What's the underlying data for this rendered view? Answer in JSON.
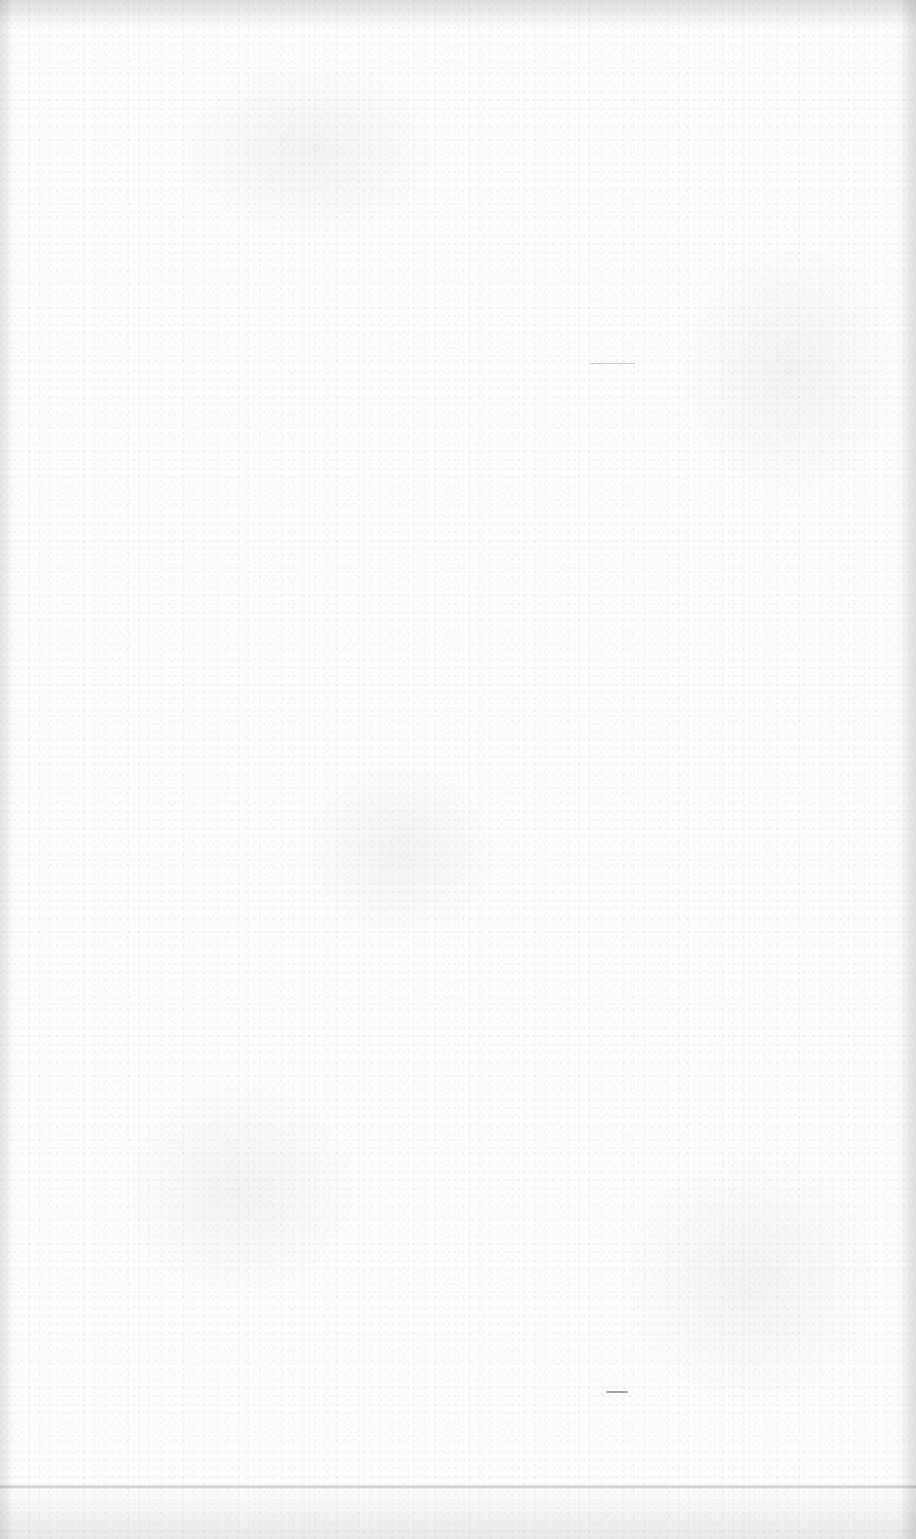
{
  "document": {
    "type": "blank-scanned-page",
    "visible_text": [],
    "background_color": "#fdfdfd",
    "artifacts": {
      "fold_line_y": 1487,
      "dash_mark": {
        "x": 606,
        "y": 1392
      },
      "edge_shading": [
        "top",
        "left",
        "right",
        "bottom"
      ]
    }
  }
}
